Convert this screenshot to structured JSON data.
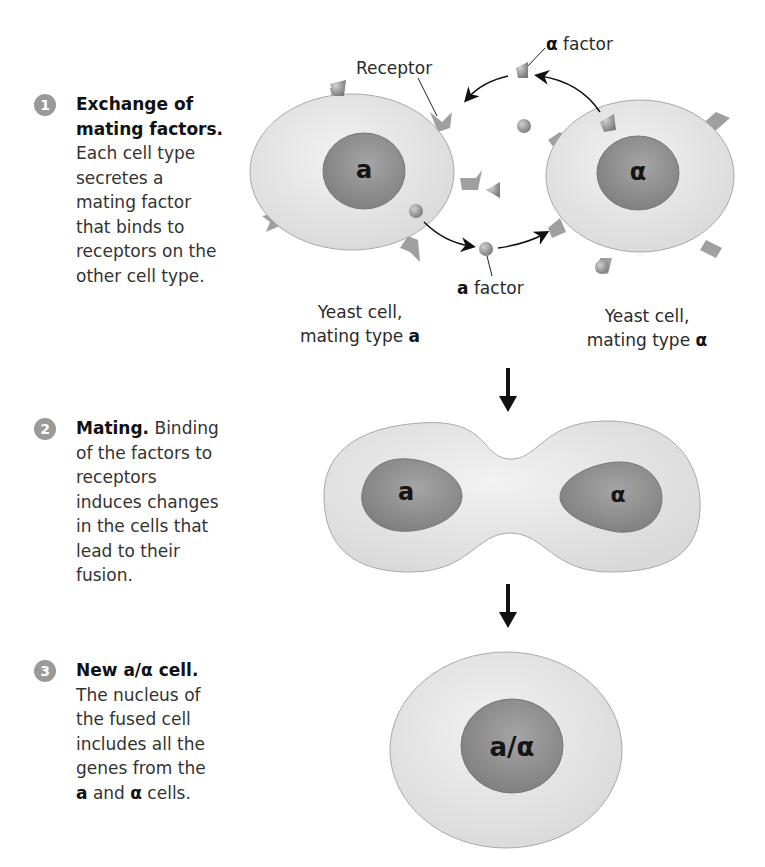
{
  "steps": [
    {
      "number": "1",
      "title": "Exchange of mating factors.",
      "title_line1": "Exchange of",
      "title_line2": "mating factors.",
      "body_lines": [
        "Each cell type",
        "secretes a",
        "mating factor",
        "that binds to",
        "receptors on the",
        "other cell type."
      ]
    },
    {
      "number": "2",
      "title": "Mating.",
      "body_first": " Binding",
      "body_lines": [
        "of the factors to",
        "receptors",
        "induces changes",
        "in the cells that",
        "lead to their",
        "fusion."
      ]
    },
    {
      "number": "3",
      "title": "New a/α cell.",
      "body_lines": [
        "The nucleus of",
        "the fused cell",
        "includes all the",
        "genes from the"
      ],
      "last_line": {
        "a": "a",
        "and": " and ",
        "alpha": "α",
        "rest": " cells."
      }
    }
  ],
  "labels": {
    "receptor": "Receptor",
    "alpha_factor": {
      "symbol": "α",
      "text": " factor"
    },
    "a_factor": {
      "symbol": "a",
      "text": " factor"
    },
    "cell_a": {
      "line1": "Yeast cell,",
      "line2": "mating type ",
      "type": "a"
    },
    "cell_alpha": {
      "line1": "Yeast cell,",
      "line2": "mating type ",
      "type": "α"
    }
  },
  "nuclei": {
    "cell_a": "a",
    "cell_alpha": "α",
    "fusing_a": "a",
    "fusing_alpha": "α",
    "diploid": "a/α"
  },
  "colors": {
    "cytoplasm": "#e4e4e4",
    "nucleus": "#8f8f8f",
    "outline": "#9a9a9a",
    "receptor": "#a0a0a0",
    "arrow": "#111111"
  }
}
